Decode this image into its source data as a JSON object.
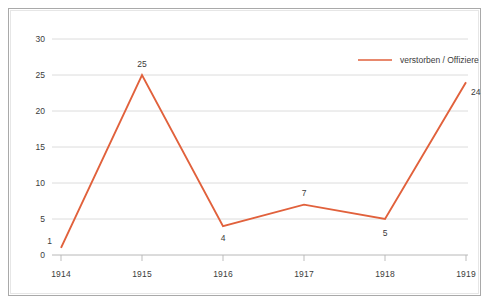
{
  "chart_data": {
    "type": "line",
    "title": "",
    "subtitle": "",
    "xlabel": "",
    "ylabel": "",
    "categories": [
      "1914",
      "1915",
      "1916",
      "1917",
      "1918",
      "1919"
    ],
    "x": [
      1914,
      1915,
      1916,
      1917,
      1918,
      1919
    ],
    "series": [
      {
        "name": "verstorben / Offiziere",
        "color": "#e1613c",
        "values": [
          1,
          25,
          4,
          7,
          5,
          24
        ],
        "point_labels": [
          "1",
          "25",
          "4",
          "7",
          "5",
          "24"
        ],
        "point_label_positions": [
          "left",
          "above",
          "below",
          "above",
          "below",
          "right"
        ]
      }
    ],
    "ylim": [
      0,
      30
    ],
    "yticks": [
      0,
      5,
      10,
      15,
      20,
      25,
      30
    ],
    "ytick_labels": [
      "0",
      "5",
      "10",
      "15",
      "20",
      "25",
      "30"
    ],
    "xtick_labels": [
      "1914",
      "1915",
      "1916",
      "1917",
      "1918",
      "1919"
    ],
    "grid": {
      "horizontal": true,
      "vertical": false,
      "color": "#d3d3d3"
    },
    "legend": {
      "position": "top-right",
      "entries": [
        {
          "label": "verstorben / Offiziere",
          "color": "#e1613c",
          "marker": "line"
        }
      ]
    },
    "background": "#ffffff",
    "frame_color": "#a9a9a9",
    "axis_color": "#b0b0b0",
    "text_color": "#3b3b3b"
  }
}
